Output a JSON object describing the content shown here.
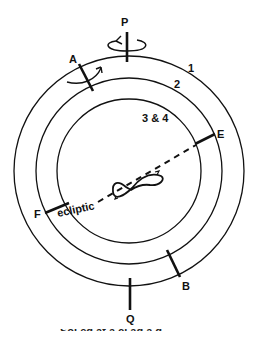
{
  "diagram": {
    "colors": {
      "stroke": "#111111",
      "background": "#ffffff"
    },
    "rings": [
      {
        "id": "1",
        "label": "1",
        "radius": 115
      },
      {
        "id": "2",
        "label": "2",
        "radius": 93
      },
      {
        "id": "3-4",
        "label": "3 & 4",
        "radius": 72
      }
    ],
    "axis_points": {
      "top": "P",
      "bottom": "Q",
      "upper_left": "A",
      "lower_right": "B",
      "right": "E",
      "left": "F"
    },
    "ecliptic_label": "ecliptic",
    "center_figure": "figure-eight (analemma-like) loop with direction arrows",
    "caption_partial": "Sol   ed at a       cl ad   a   d"
  }
}
